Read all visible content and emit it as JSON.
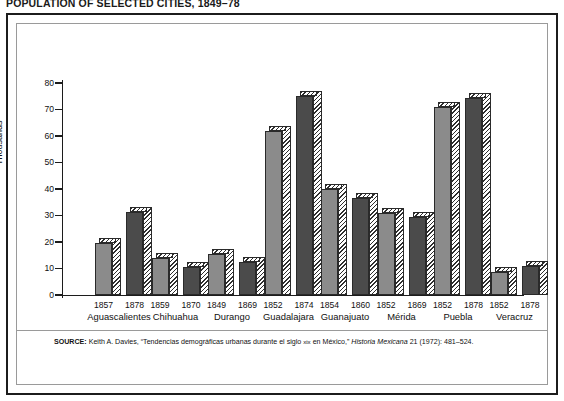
{
  "figure": {
    "title": "POPULATION OF SELECTED CITIES, 1849–78"
  },
  "source": {
    "label": "SOURCE:",
    "author": " Keith A. Davies, “Tendencias demográficas urbanas durante el siglo ",
    "smallcaps": "xix",
    "middle": " en México,” ",
    "journal": "Historia Mexicana",
    "tail": " 21 (1972): 481–524."
  },
  "chart_data": {
    "type": "bar",
    "title": "POPULATION OF SELECTED CITIES, 1849–78",
    "xlabel": "",
    "ylabel": "Thousands",
    "ylim": [
      0,
      80
    ],
    "yticks": [
      0,
      10,
      20,
      30,
      40,
      50,
      60,
      70,
      80
    ],
    "ytick_labels": [
      "0",
      "10",
      "20",
      "30",
      "40",
      "50",
      "60",
      "70",
      "80"
    ],
    "grid": false,
    "legend": "none",
    "units": "thousands of inhabitants",
    "categories": [
      "Aguascalientes",
      "Chihuahua",
      "Durango",
      "Guadalajara",
      "Guanajuato",
      "Mérida",
      "Puebla",
      "Veracruz"
    ],
    "bars": [
      {
        "city": "Aguascalientes",
        "year": "1857",
        "value": 19.5,
        "shade": "light"
      },
      {
        "city": "Aguascalientes",
        "year": "1878",
        "value": 31.5,
        "shade": "dark"
      },
      {
        "city": "Chihuahua",
        "year": "1859",
        "value": 14.0,
        "shade": "light"
      },
      {
        "city": "Chihuahua",
        "year": "1870",
        "value": 10.5,
        "shade": "dark"
      },
      {
        "city": "Durango",
        "year": "1849",
        "value": 15.5,
        "shade": "light"
      },
      {
        "city": "Durango",
        "year": "1869",
        "value": 12.5,
        "shade": "dark"
      },
      {
        "city": "Guadalajara",
        "year": "1852",
        "value": 62.0,
        "shade": "light"
      },
      {
        "city": "Guadalajara",
        "year": "1874",
        "value": 75.0,
        "shade": "dark"
      },
      {
        "city": "Guanajuato",
        "year": "1854",
        "value": 40.0,
        "shade": "light"
      },
      {
        "city": "Guanajuato",
        "year": "1860",
        "value": 36.5,
        "shade": "dark"
      },
      {
        "city": "Mérida",
        "year": "1852",
        "value": 31.0,
        "shade": "light"
      },
      {
        "city": "Mérida",
        "year": "1869",
        "value": 29.5,
        "shade": "dark"
      },
      {
        "city": "Puebla",
        "year": "1852",
        "value": 71.0,
        "shade": "light"
      },
      {
        "city": "Puebla",
        "year": "1878",
        "value": 74.5,
        "shade": "dark"
      },
      {
        "city": "Veracruz",
        "year": "1852",
        "value": 8.5,
        "shade": "light"
      },
      {
        "city": "Veracruz",
        "year": "1878",
        "value": 11.0,
        "shade": "dark"
      }
    ],
    "series": [
      {
        "name": "Earlier year",
        "years": [
          "1857",
          "1859",
          "1849",
          "1852",
          "1854",
          "1852",
          "1852",
          "1852"
        ],
        "values": [
          19.5,
          14.0,
          15.5,
          62.0,
          40.0,
          31.0,
          71.0,
          8.5
        ]
      },
      {
        "name": "Later year",
        "years": [
          "1878",
          "1870",
          "1869",
          "1874",
          "1860",
          "1869",
          "1878",
          "1878"
        ],
        "values": [
          31.5,
          10.5,
          12.5,
          75.0,
          36.5,
          29.5,
          74.5,
          11.0
        ]
      }
    ],
    "colors": {
      "earlier_bar": "#8b8b8b",
      "later_bar": "#4b4b4b",
      "hatch": "#2e2e2e",
      "axis": "#1c1c1c",
      "frame": "#1c1c1c",
      "inner_frame": "#9a9a9a",
      "background": "#ffffff"
    }
  }
}
